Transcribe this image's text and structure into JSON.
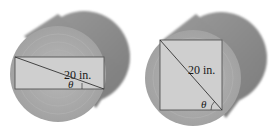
{
  "figure": {
    "colors": {
      "background": "#ffffff",
      "log_side": "#8c8c8c",
      "log_face": "#a9a9a9",
      "rings": "#b4b4b4",
      "rectangle_fill": "#cfcfcf",
      "rectangle_stroke": "#555555",
      "diagonal": "#333333"
    },
    "panels": [
      {
        "id": "left",
        "shape": "wide rectangle",
        "diagonal_label": "20 in.",
        "angle_label": "θ",
        "angle_marker": "right-angle tick"
      },
      {
        "id": "right",
        "shape": "square",
        "diagonal_label": "20 in.",
        "angle_label": "θ",
        "angle_marker": "arc"
      }
    ]
  }
}
